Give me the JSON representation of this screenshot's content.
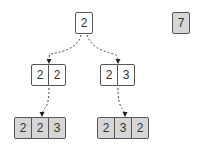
{
  "diagram": {
    "root": {
      "cells": [
        "2"
      ]
    },
    "middle_left": {
      "cells": [
        "2",
        "2"
      ]
    },
    "middle_right": {
      "cells": [
        "2",
        "3"
      ]
    },
    "bottom_left": {
      "cells": [
        "2",
        "2",
        "3"
      ]
    },
    "bottom_right": {
      "cells": [
        "2",
        "3",
        "2"
      ]
    },
    "side_box": {
      "cells": [
        "7"
      ]
    },
    "edges": [
      {
        "from": "root",
        "to": "middle_left",
        "style": "dashed-arrow"
      },
      {
        "from": "root",
        "to": "middle_right",
        "style": "dashed-arrow"
      },
      {
        "from": "middle_left",
        "to": "bottom_left",
        "style": "dashed-arrow"
      },
      {
        "from": "middle_right",
        "to": "bottom_right",
        "style": "dashed-arrow"
      }
    ],
    "colors": {
      "filled": "#d6d6d6",
      "empty": "#ffffff",
      "border": "#555555"
    }
  }
}
